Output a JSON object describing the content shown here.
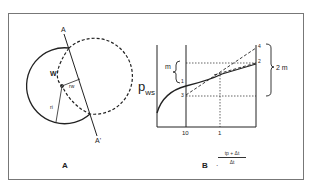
{
  "panel_a": {
    "label": "A",
    "line_top_label": "A",
    "line_bottom_label": "A'",
    "well_label": "W",
    "radius_w_label": "rw",
    "radius_i_label": "ri"
  },
  "panel_b": {
    "label": "B",
    "mark": "·",
    "ylabel_main": "p",
    "ylabel_sub": "ws",
    "x_ticks": [
      "10",
      "1"
    ],
    "xlabel_num": "tp + Δt",
    "xlabel_den": "Δt",
    "slope_label_m": "m",
    "slope_label_2m": "2 m",
    "point_labels": [
      "1",
      "2",
      "3",
      "4"
    ]
  }
}
